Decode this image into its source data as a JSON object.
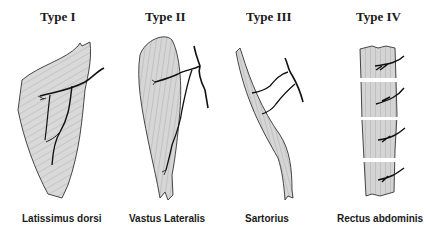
{
  "figure": {
    "panels": [
      {
        "type_label": "Type I",
        "muscle": "Latissimus dorsi"
      },
      {
        "type_label": "Type II",
        "muscle": "Vastus Lateralis"
      },
      {
        "type_label": "Type III",
        "muscle": "Sartorius"
      },
      {
        "type_label": "Type IV",
        "muscle": "Rectus abdominis"
      }
    ],
    "colors": {
      "muscle_fill": "#d6d6d6",
      "outline": "#333333",
      "vessel": "#111111"
    }
  }
}
